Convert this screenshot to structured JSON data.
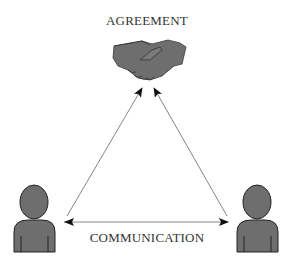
{
  "diagram": {
    "top_node": {
      "label": "AGREEMENT",
      "icon": "handshake-icon"
    },
    "bottom_edge": {
      "label": "COMMUNICATION"
    },
    "left_node": {
      "icon": "person-icon"
    },
    "right_node": {
      "icon": "person-icon"
    },
    "edges": [
      {
        "from": "left-person",
        "to": "handshake",
        "type": "arrow"
      },
      {
        "from": "right-person",
        "to": "handshake",
        "type": "arrow"
      },
      {
        "from": "left-person",
        "to": "right-person",
        "type": "double-arrow"
      }
    ],
    "colors": {
      "icon_fill": "#6e6e6e",
      "icon_stroke": "#2a2a2a",
      "line": "#555555",
      "text": "#333333"
    }
  }
}
